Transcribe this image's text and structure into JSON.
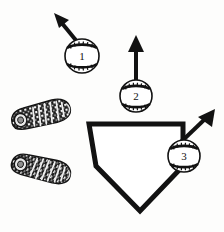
{
  "figure": {
    "kind": "baseball-hitting-zone-diagram",
    "background_color": "#fdfdfc",
    "ink_color": "#121212",
    "width": 224,
    "height": 232
  },
  "home_plate": {
    "name": "home-plate",
    "fill_color": "#ffffff",
    "stroke_color": "#121212",
    "stroke_width": 5,
    "points": "89,124 183,124 183,166 140,211 96,166"
  },
  "batter_shoes": [
    {
      "name": "shoe-print-front",
      "label": "",
      "center_x": 41,
      "center_y": 115,
      "rotation_deg": -14,
      "length": 60,
      "width": 26,
      "fill_color": "#1b1b1b"
    },
    {
      "name": "shoe-print-back",
      "label": "",
      "center_x": 41,
      "center_y": 169,
      "rotation_deg": 13,
      "length": 60,
      "width": 26,
      "fill_color": "#1b1b1b"
    }
  ],
  "baseballs": [
    {
      "id": "ball-1",
      "number": "1",
      "center_x": 82,
      "center_y": 56,
      "radius": 17,
      "fill_color": "#ffffff",
      "stroke_color": "#121212"
    },
    {
      "id": "ball-2",
      "number": "2",
      "center_x": 136,
      "center_y": 96,
      "radius": 16,
      "fill_color": "#ffffff",
      "stroke_color": "#121212"
    },
    {
      "id": "ball-3",
      "number": "3",
      "center_x": 184,
      "center_y": 156,
      "radius": 16,
      "fill_color": "#ffffff",
      "stroke_color": "#121212"
    }
  ],
  "arrows": [
    {
      "id": "arrow-1",
      "for_ball": "1",
      "direction": "up-left",
      "x1": 79,
      "y1": 44,
      "x2": 56,
      "y2": 16,
      "stroke_width": 4,
      "color": "#121212"
    },
    {
      "id": "arrow-2",
      "for_ball": "2",
      "direction": "up",
      "x1": 136,
      "y1": 80,
      "x2": 136,
      "y2": 36,
      "stroke_width": 4,
      "color": "#121212"
    },
    {
      "id": "arrow-3",
      "for_ball": "3",
      "direction": "up-right",
      "x1": 181,
      "y1": 142,
      "x2": 214,
      "y2": 110,
      "stroke_width": 4,
      "color": "#121212"
    }
  ]
}
